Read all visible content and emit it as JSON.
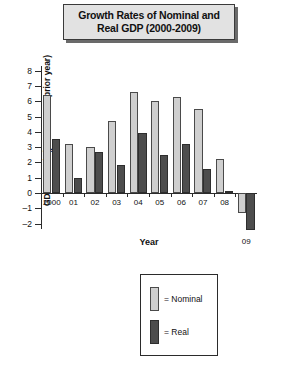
{
  "title": {
    "line1": "Growth Rates of Nominal and",
    "line2": "Real GDP (2000-2009)"
  },
  "axes": {
    "xlabel": "Year",
    "ylabel": "GDP Growth (percent over prior year)"
  },
  "legend": {
    "nominal": "= Nominal",
    "real": "= Real"
  },
  "colors": {
    "nominal": "#cfcfcf",
    "real": "#4d4d4d",
    "axis": "#2b2b2b",
    "title_bg": "#e2e2e2"
  },
  "chart_data": {
    "type": "bar",
    "title": "Growth Rates of Nominal and Real GDP (2000-2009)",
    "xlabel": "Year",
    "ylabel": "GDP Growth (percent over prior year)",
    "categories": [
      "2000",
      "01",
      "02",
      "03",
      "04",
      "05",
      "06",
      "07",
      "08",
      "09"
    ],
    "yticks": [
      8,
      7,
      6,
      5,
      4,
      3,
      2,
      1,
      0,
      -1,
      -2
    ],
    "ylim": [
      -2.6,
      8.4
    ],
    "grid": false,
    "legend_position": "below-plot",
    "series": [
      {
        "name": "Nominal",
        "color": "#cfcfcf",
        "values": [
          6.4,
          3.2,
          3.0,
          4.7,
          6.6,
          6.0,
          6.3,
          5.5,
          2.2,
          -1.3
        ]
      },
      {
        "name": "Real",
        "color": "#4d4d4d",
        "values": [
          3.5,
          1.0,
          2.7,
          1.8,
          3.9,
          2.5,
          3.2,
          1.6,
          0.1,
          -2.4
        ]
      }
    ]
  }
}
